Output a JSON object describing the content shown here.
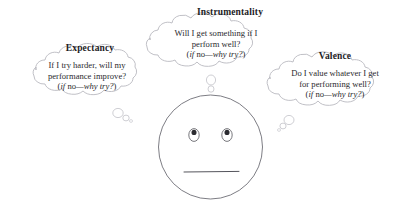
{
  "diagram": {
    "title_visible": false,
    "background_color": "#ffffff",
    "outline_color": "#b9b9bf",
    "face_outline_color": "#6e6e76",
    "text_color": "#2a2a2e",
    "heading_color": "#1d1d1f",
    "face": {
      "name": "neutral-face",
      "expression": "neutral",
      "mouth": "straight-line",
      "eyes": 2
    },
    "bubbles": [
      {
        "id": "expectancy",
        "heading": "Expectancy",
        "lines": [
          "If I try harder, will my",
          "performance improve?"
        ],
        "tagline": {
          "open": "(",
          "if": "if",
          "no": " no",
          "dash_phrase": "—why try?",
          "close": ")"
        },
        "tagline_plain": "(if no—why try?)"
      },
      {
        "id": "instrumentality",
        "heading": "Instrumentality",
        "lines": [
          "Will I get something if I",
          "perform well?"
        ],
        "tagline": {
          "open": "(",
          "if": "if",
          "no": " no",
          "dash_phrase": "—why try?",
          "close": ")"
        },
        "tagline_plain": "(if no—why try?)"
      },
      {
        "id": "valence",
        "heading": "Valence",
        "lines": [
          "Do I value whatever I get",
          "for performing well?"
        ],
        "tagline": {
          "open": "(",
          "if": "if",
          "no": " no",
          "dash_phrase": "—why try?",
          "close": ")"
        },
        "tagline_plain": "(if no—why try?)"
      }
    ]
  }
}
